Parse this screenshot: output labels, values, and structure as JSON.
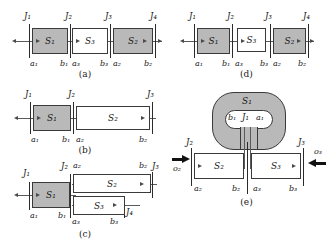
{
  "figure": {
    "panels": [
      {
        "id": "a",
        "caption": "(a)",
        "junctions": [
          "J₁",
          "J₂",
          "J₃",
          "J₄"
        ],
        "segments": [
          {
            "label": "S₁",
            "shaded": true,
            "start": "a₁",
            "end": "b₁"
          },
          {
            "label": "S₃",
            "shaded": false,
            "start": "a₃",
            "end": "b₃"
          },
          {
            "label": "S₂",
            "shaded": true,
            "start": "a₂",
            "end": "b₂"
          }
        ]
      },
      {
        "id": "d",
        "caption": "(d)",
        "junctions": [
          "J₁",
          "J₂",
          "J₃",
          "J₄"
        ],
        "segments": [
          {
            "label": "S₁",
            "shaded": true,
            "start": "a₁",
            "end": "b₁"
          },
          {
            "label": "S₃",
            "shaded": false,
            "start": "a₃",
            "end": "b₃"
          },
          {
            "label": "S₂",
            "shaded": true,
            "start": "a₂",
            "end": "b₂"
          }
        ]
      },
      {
        "id": "b",
        "caption": "(b)",
        "junctions": [
          "J₁",
          "J₂",
          "J₃"
        ],
        "segments": [
          {
            "label": "S₁",
            "shaded": true,
            "start": "a₁",
            "end": "b₁"
          },
          {
            "label": "S₂",
            "shaded": false,
            "start": "a₂",
            "end": "b₂"
          }
        ]
      },
      {
        "id": "c",
        "caption": "(c)",
        "junctions": [
          "J₁",
          "J₂",
          "J₃",
          "J₄"
        ],
        "segments": [
          {
            "label": "S₁",
            "shaded": true,
            "start": "a₁",
            "end": "b₁"
          },
          {
            "label": "S₂",
            "shaded": false,
            "start": "a₂",
            "end": "b₂"
          },
          {
            "label": "S₃",
            "shaded": false,
            "start": "a₃",
            "end": "b₃"
          }
        ]
      },
      {
        "id": "e",
        "caption": "(e)",
        "junctions": [
          "J₁",
          "J₂",
          "J₃"
        ],
        "segments": [
          {
            "label": "S₁",
            "shaded": true,
            "start": "a₁",
            "end": "b₁"
          },
          {
            "label": "S₂",
            "shaded": false,
            "start": "a₂",
            "end": "b₂"
          },
          {
            "label": "S₃",
            "shaded": false,
            "start": "a₃",
            "end": "b₃"
          }
        ],
        "inputs": [
          "o₂",
          "o₃"
        ]
      }
    ],
    "colors": {
      "shaded_fill": "#b9b9b9",
      "plain_fill": "#ffffff",
      "stroke": "#3a3a3a",
      "arrow": "#4a4a4a",
      "bold_arrow": "#111111",
      "background": "#ffffff"
    }
  }
}
